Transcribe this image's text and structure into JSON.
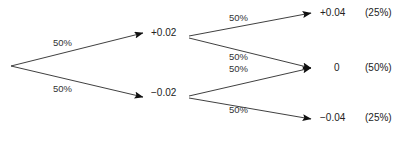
{
  "diagram": {
    "type": "binomial-tree",
    "title": "",
    "root": {
      "label": ""
    },
    "levels": [
      {
        "name": "step-1",
        "nodes": [
          {
            "id": "up",
            "label": "+0.02",
            "probability_label": "50%"
          },
          {
            "id": "down",
            "label": "−0.02",
            "probability_label": "50%"
          }
        ]
      },
      {
        "name": "step-2",
        "nodes": [
          {
            "id": "up-up",
            "label": "+0.04",
            "probability_label": "50%",
            "cumulative": "(25%)"
          },
          {
            "id": "mid-from-up",
            "label": "0",
            "probability_label": "50%",
            "cumulative": "(50%)"
          },
          {
            "id": "mid-from-down",
            "label": "",
            "probability_label": "50%",
            "cumulative": ""
          },
          {
            "id": "down-down",
            "label": "−0.04",
            "probability_label": "50%",
            "cumulative": "(25%)"
          }
        ]
      }
    ],
    "edge_labels": {
      "root_to_up": "50%",
      "root_to_down": "50%",
      "up_to_upup": "50%",
      "up_to_mid": "50%",
      "down_to_mid": "50%",
      "down_to_downdown": "50%"
    },
    "outcomes": [
      {
        "value": "+0.04",
        "probability": "(25%)"
      },
      {
        "value": "0",
        "probability": "(50%)"
      },
      {
        "value": "−0.04",
        "probability": "(25%)"
      }
    ],
    "colors": {
      "line": "#2a2a2a",
      "text": "#222222",
      "background": "#ffffff"
    }
  }
}
